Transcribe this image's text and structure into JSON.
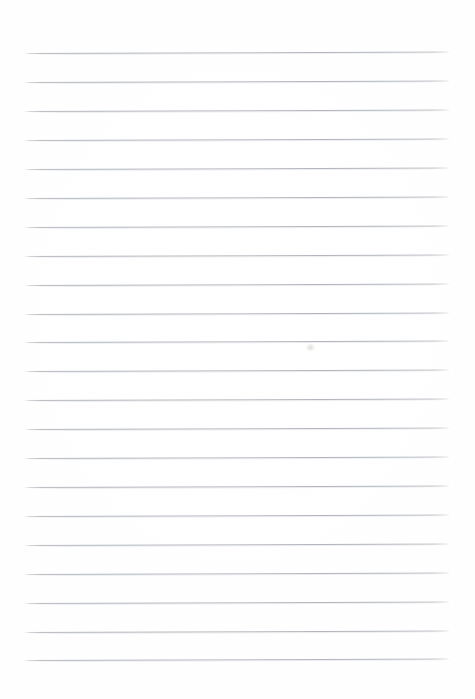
{
  "document": {
    "kind": "scanned-ruled-paper",
    "title": "Blank Ruled Notebook Page",
    "content_text": "",
    "page_width": 475,
    "page_height": 699,
    "background_color": "#fefefe",
    "paper_tone_color": "#fdfdfc"
  },
  "ruling": {
    "line_color": "#b4b8be",
    "line_halo_color": "#cdd0d4",
    "line_count": 22,
    "line_thickness_px": 1,
    "line_spacing_px": 28.9,
    "first_line_y": 53,
    "last_line_y": 660,
    "line_left_x": 24,
    "line_right_x": 450,
    "skew_degrees": -0.2,
    "lines": [
      {
        "index": 1,
        "y": 53,
        "x1": 24,
        "x2": 450
      },
      {
        "index": 2,
        "y": 82,
        "x1": 24,
        "x2": 450
      },
      {
        "index": 3,
        "y": 111,
        "x1": 24,
        "x2": 450
      },
      {
        "index": 4,
        "y": 140,
        "x1": 24,
        "x2": 450
      },
      {
        "index": 5,
        "y": 169,
        "x1": 24,
        "x2": 450
      },
      {
        "index": 6,
        "y": 198,
        "x1": 24,
        "x2": 450
      },
      {
        "index": 7,
        "y": 227,
        "x1": 24,
        "x2": 450
      },
      {
        "index": 8,
        "y": 256,
        "x1": 24,
        "x2": 450
      },
      {
        "index": 9,
        "y": 285,
        "x1": 24,
        "x2": 450
      },
      {
        "index": 10,
        "y": 314,
        "x1": 24,
        "x2": 450
      },
      {
        "index": 11,
        "y": 342,
        "x1": 24,
        "x2": 450
      },
      {
        "index": 12,
        "y": 371,
        "x1": 24,
        "x2": 450
      },
      {
        "index": 13,
        "y": 400,
        "x1": 24,
        "x2": 450
      },
      {
        "index": 14,
        "y": 429,
        "x1": 24,
        "x2": 450
      },
      {
        "index": 15,
        "y": 458,
        "x1": 24,
        "x2": 450
      },
      {
        "index": 16,
        "y": 487,
        "x1": 24,
        "x2": 450
      },
      {
        "index": 17,
        "y": 516,
        "x1": 24,
        "x2": 450
      },
      {
        "index": 18,
        "y": 545,
        "x1": 24,
        "x2": 450
      },
      {
        "index": 19,
        "y": 574,
        "x1": 24,
        "x2": 450
      },
      {
        "index": 20,
        "y": 603,
        "x1": 24,
        "x2": 450
      },
      {
        "index": 21,
        "y": 632,
        "x1": 24,
        "x2": 450
      },
      {
        "index": 22,
        "y": 660,
        "x1": 24,
        "x2": 450
      }
    ]
  },
  "marks": [
    {
      "name": "faint-smudge",
      "x": 310,
      "y": 347,
      "width": 9,
      "height": 7
    }
  ]
}
